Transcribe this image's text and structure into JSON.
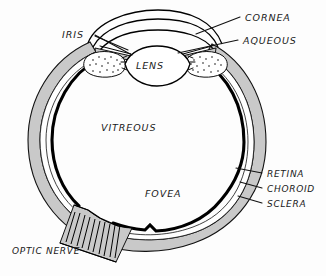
{
  "figure": {
    "background_color": "#fdfdfd",
    "ink_color": "#000000",
    "shading_color": "#c9c9c9",
    "width": 326,
    "height": 276
  },
  "labels": {
    "cornea": "CORNEA",
    "aqueous": "AQUEOUS",
    "iris": "IRIS",
    "lens": "LENS",
    "vitreous": "VITREOUS",
    "fovea": "FOVEA",
    "retina": "RETINA",
    "choroid": "CHOROID",
    "sclera": "SCLERA",
    "optic_nerve": "OPTIC NERVE"
  },
  "structures": [
    {
      "name": "cornea",
      "label": "CORNEA",
      "leader": true,
      "side": "top-right"
    },
    {
      "name": "aqueous",
      "label": "AQUEOUS",
      "leader": true,
      "side": "top-right"
    },
    {
      "name": "iris",
      "label": "IRIS",
      "leader": true,
      "side": "top-left"
    },
    {
      "name": "lens",
      "label": "LENS",
      "leader": false,
      "side": "center-top"
    },
    {
      "name": "vitreous",
      "label": "VITREOUS",
      "leader": false,
      "side": "center"
    },
    {
      "name": "fovea",
      "label": "FOVEA",
      "leader": false,
      "side": "center-bottom"
    },
    {
      "name": "retina",
      "label": "RETINA",
      "leader": true,
      "side": "right"
    },
    {
      "name": "choroid",
      "label": "CHOROID",
      "leader": true,
      "side": "right"
    },
    {
      "name": "sclera",
      "label": "SCLERA",
      "leader": true,
      "side": "right"
    },
    {
      "name": "optic-nerve",
      "label": "OPTIC NERVE",
      "leader": false,
      "side": "bottom-left"
    }
  ]
}
